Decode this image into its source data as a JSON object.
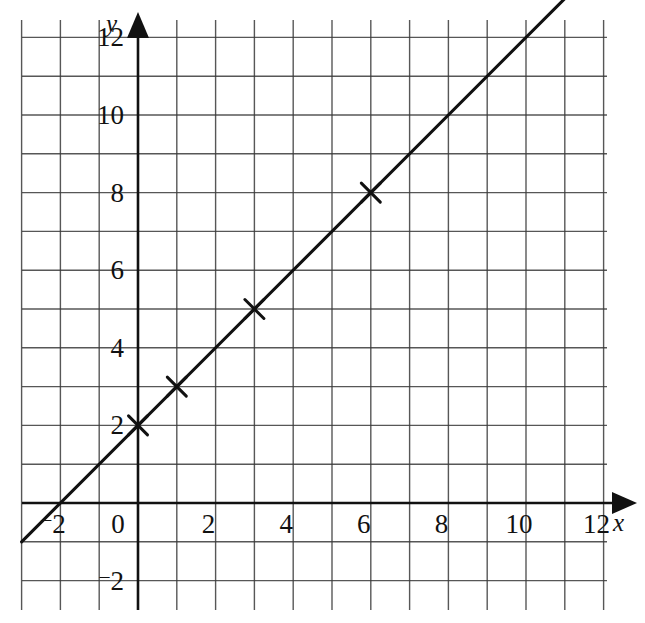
{
  "figure": {
    "kind": "hand-drawn-coordinate-grid",
    "background_color": "#ffffff",
    "grid_color": "#3a3a3a",
    "axis_color": "#111111",
    "line_color": "#111111",
    "marker_color": "#111111"
  },
  "axes": {
    "x_axis_label": "x",
    "y_axis_label": "y",
    "x_ticks": [
      {
        "value": -2,
        "label": "2",
        "minus_sign": "¯"
      },
      {
        "value": 0,
        "label": "0",
        "minus_sign": ""
      },
      {
        "value": 2,
        "label": "2",
        "minus_sign": ""
      },
      {
        "value": 4,
        "label": "4",
        "minus_sign": ""
      },
      {
        "value": 6,
        "label": "6",
        "minus_sign": ""
      },
      {
        "value": 8,
        "label": "8",
        "minus_sign": ""
      },
      {
        "value": 10,
        "label": "10",
        "minus_sign": ""
      },
      {
        "value": 12,
        "label": "12",
        "minus_sign": ""
      }
    ],
    "y_ticks": [
      {
        "value": 12,
        "label": "12",
        "minus_sign": ""
      },
      {
        "value": 10,
        "label": "10",
        "minus_sign": ""
      },
      {
        "value": 8,
        "label": "8",
        "minus_sign": ""
      },
      {
        "value": 6,
        "label": "6",
        "minus_sign": ""
      },
      {
        "value": 4,
        "label": "4",
        "minus_sign": ""
      },
      {
        "value": 2,
        "label": "2",
        "minus_sign": ""
      },
      {
        "value": 0,
        "label": "0",
        "minus_sign": ""
      },
      {
        "value": -2,
        "label": "2",
        "minus_sign": "¯"
      }
    ]
  },
  "chart_data": {
    "type": "line",
    "title": "",
    "xlabel": "x",
    "ylabel": "y",
    "xlim": [
      -3,
      13
    ],
    "ylim": [
      -3,
      13
    ],
    "grid": true,
    "grid_step": 1,
    "legend": "none",
    "series": [
      {
        "name": "y = x + 2",
        "kind": "straight-line",
        "equation": "y = x + 2",
        "slope": 1,
        "intercept": 2,
        "drawn_from": {
          "x": -3,
          "y": -1
        },
        "drawn_to": {
          "x": 11,
          "y": 13
        },
        "marker": "x-cross",
        "points": [
          {
            "x": 0,
            "y": 2
          },
          {
            "x": 1,
            "y": 3
          },
          {
            "x": 3,
            "y": 5
          },
          {
            "x": 6,
            "y": 8
          }
        ]
      }
    ],
    "x_tick_values": [
      -2,
      0,
      2,
      4,
      6,
      8,
      10,
      12
    ],
    "y_tick_values": [
      -2,
      0,
      2,
      4,
      6,
      8,
      10,
      12
    ]
  }
}
